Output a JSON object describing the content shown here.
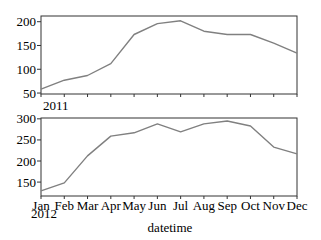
{
  "chart_data": [
    {
      "type": "line",
      "panel": "top",
      "title": "",
      "xlabel": "",
      "ylabel": "",
      "year_label": "2011",
      "categories": [
        "Jan",
        "Feb",
        "Mar",
        "Apr",
        "May",
        "Jun",
        "Jul",
        "Aug",
        "Sep",
        "Oct",
        "Nov",
        "Dec"
      ],
      "values": [
        58,
        77,
        87,
        112,
        173,
        196,
        202,
        180,
        173,
        173,
        155,
        134
      ],
      "ylim": [
        48,
        212
      ],
      "yticks": [
        50,
        100,
        150,
        200
      ],
      "grid": false,
      "line_color": "#808080"
    },
    {
      "type": "line",
      "panel": "bottom",
      "title": "",
      "xlabel": "datetime",
      "ylabel": "",
      "year_label": "2012",
      "categories": [
        "Jan",
        "Feb",
        "Mar",
        "Apr",
        "May",
        "Jun",
        "Jul",
        "Aug",
        "Sep",
        "Oct",
        "Nov",
        "Dec"
      ],
      "values": [
        129,
        148,
        212,
        259,
        267,
        288,
        269,
        288,
        295,
        283,
        233,
        217
      ],
      "ylim": [
        117,
        302
      ],
      "yticks": [
        150,
        200,
        250,
        300
      ],
      "grid": false,
      "line_color": "#808080"
    }
  ],
  "layout": {
    "plot_left": 41,
    "plot_right": 297,
    "panels": [
      {
        "top": 16,
        "bottom": 94
      },
      {
        "top": 118,
        "bottom": 196
      }
    ],
    "frame_color": "#333333"
  }
}
